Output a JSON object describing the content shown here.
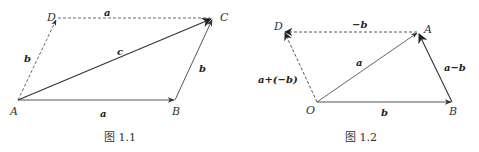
{
  "figures": [
    {
      "caption": "图 1.1",
      "points": {
        "A": {
          "label": "A",
          "x": 18,
          "y": 100
        },
        "B": {
          "label": "B",
          "x": 175,
          "y": 100
        },
        "C": {
          "label": "C",
          "x": 213,
          "y": 18
        },
        "D": {
          "label": "D",
          "x": 57,
          "y": 18
        }
      },
      "vectors": [
        {
          "from": "A",
          "to": "B",
          "label": "a",
          "style": "solid"
        },
        {
          "from": "B",
          "to": "C",
          "label": "b",
          "style": "solid"
        },
        {
          "from": "A",
          "to": "C",
          "label": "c",
          "style": "solid"
        },
        {
          "from": "A",
          "to": "D",
          "label": "b",
          "style": "dashed"
        },
        {
          "from": "D",
          "to": "C",
          "label": "a",
          "style": "dashed"
        }
      ]
    },
    {
      "caption": "图 1.2",
      "points": {
        "O": {
          "label": "O",
          "x": 317,
          "y": 102
        },
        "B": {
          "label": "B",
          "x": 452,
          "y": 102
        },
        "A": {
          "label": "A",
          "x": 418,
          "y": 32
        },
        "D": {
          "label": "D",
          "x": 284,
          "y": 32
        }
      },
      "vectors": [
        {
          "from": "O",
          "to": "B",
          "label": "b",
          "style": "solid"
        },
        {
          "from": "O",
          "to": "A",
          "label": "a",
          "style": "solid"
        },
        {
          "from": "B",
          "to": "A",
          "label": "a−b",
          "style": "solid"
        },
        {
          "from": "A",
          "to": "D",
          "label": "−b",
          "style": "dashed"
        },
        {
          "from": "O",
          "to": "D",
          "label": "a+(−b)",
          "style": "dashed"
        }
      ]
    }
  ]
}
